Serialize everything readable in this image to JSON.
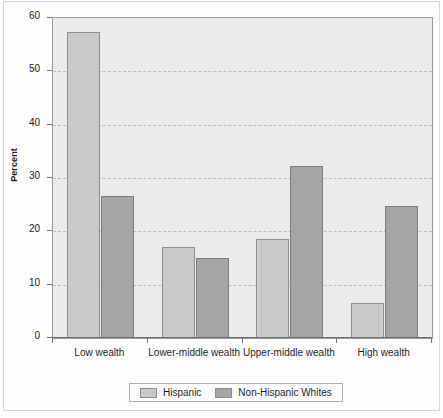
{
  "chart_data": {
    "type": "bar",
    "title": "",
    "xlabel": "",
    "ylabel": "Percent",
    "ylim": [
      0,
      60
    ],
    "yticks": [
      0,
      10,
      20,
      30,
      40,
      50,
      60
    ],
    "ytick_labels": [
      "0",
      "10",
      "20",
      "30",
      "40",
      "50",
      "60"
    ],
    "grid": true,
    "grid_style": "dashed-horizontal",
    "legend_position": "bottom-center",
    "categories": [
      "Low wealth",
      "Lower-middle wealth",
      "Upper-middle wealth",
      "High wealth"
    ],
    "series": [
      {
        "name": "Hispanic",
        "color": "#c9c9c9",
        "values": [
          57.4,
          17.1,
          18.6,
          6.6
        ]
      },
      {
        "name": "Non-Hispanic Whites",
        "color": "#a5a5a5",
        "values": [
          26.6,
          15.0,
          32.3,
          24.8
        ]
      }
    ]
  },
  "legend": {
    "items": [
      {
        "label": "Hispanic",
        "swatch": "hispanic"
      },
      {
        "label": "Non-Hispanic Whites",
        "swatch": "whites"
      }
    ]
  },
  "axes": {
    "y_title": "Percent"
  }
}
